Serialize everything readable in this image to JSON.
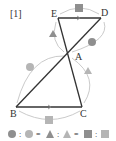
{
  "diagram": {
    "problem_label": "[1]",
    "points": [
      {
        "name": "E",
        "x": 58,
        "y": 18
      },
      {
        "name": "D",
        "x": 101,
        "y": 18
      },
      {
        "name": "A",
        "x": 68,
        "y": 54
      },
      {
        "name": "B",
        "x": 16,
        "y": 107
      },
      {
        "name": "C",
        "x": 82,
        "y": 107
      }
    ],
    "segments": [
      "E-D",
      "E-C",
      "D-B",
      "B-C"
    ],
    "angle_marks": [
      {
        "angle": "BAE",
        "symbol": "circle",
        "shade": "dark"
      },
      {
        "angle": "BAE",
        "symbol": "circle",
        "shade": "light"
      },
      {
        "angle": "DEA",
        "symbol": "triangle",
        "shade": "dark"
      },
      {
        "angle": "ACB",
        "symbol": "triangle",
        "shade": "light"
      },
      {
        "angle": "EDA",
        "symbol": "square",
        "shade": "dark"
      },
      {
        "angle": "CBA",
        "symbol": "square",
        "shade": "light"
      }
    ],
    "colors": {
      "line": "#333333",
      "arc": "#bbbbbb",
      "mark_dark": "#8f8f8f",
      "mark_light": "#b5b5b5"
    },
    "legend": {
      "sep1": ":",
      "eq1": "=",
      "sep2": ":",
      "eq2": "=",
      "sep3": ":"
    }
  }
}
